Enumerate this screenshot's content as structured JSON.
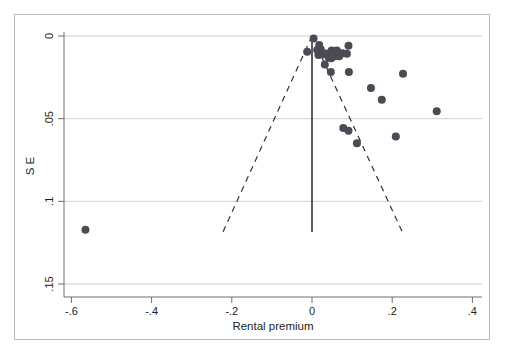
{
  "figure": {
    "type": "funnel-plot",
    "background_color": "#ffffff",
    "frame_color": "#b9b9b9"
  },
  "chart_data": {
    "type": "scatter",
    "title": "",
    "subtitle": "",
    "xlabel": "Rental premium",
    "ylabel": "S E",
    "xlim": [
      -0.72,
      0.5
    ],
    "ylim": [
      0.163,
      -0.008
    ],
    "y_inverted": true,
    "grid": "horizontal",
    "legend": "none",
    "xticks": [
      -0.6,
      -0.4,
      -0.2,
      0,
      0.2,
      0.4
    ],
    "xticklabels": [
      "-.6",
      "-.4",
      "-.2",
      "0",
      ".2",
      ".4"
    ],
    "yticks": [
      0,
      0.05,
      0.1,
      0.15
    ],
    "yticklabels": [
      "0",
      ".05",
      ".1",
      ".15"
    ],
    "marker_color": "#4b4b55",
    "marker_size": 5.4,
    "reference_line": {
      "name": "pooled-effect-line",
      "x": 0.0,
      "style": "solid",
      "color": "#333333",
      "y_from": 0.0,
      "y_to": 0.1185
    },
    "funnel_limits": {
      "name": "pseudo-95-confidence-limits",
      "style": "dashed",
      "color": "#333333",
      "apex": [
        0.0,
        0.0
      ],
      "left_end": [
        -0.222,
        0.1185
      ],
      "right_end": [
        0.225,
        0.1185
      ]
    },
    "points": [
      {
        "x": 0.004,
        "y": 0.0015
      },
      {
        "x": -0.012,
        "y": 0.0095
      },
      {
        "x": 0.018,
        "y": 0.0055
      },
      {
        "x": 0.013,
        "y": 0.0085
      },
      {
        "x": 0.022,
        "y": 0.0082
      },
      {
        "x": 0.016,
        "y": 0.0115
      },
      {
        "x": 0.026,
        "y": 0.0112
      },
      {
        "x": 0.036,
        "y": 0.0106
      },
      {
        "x": 0.049,
        "y": 0.0087
      },
      {
        "x": 0.062,
        "y": 0.0088
      },
      {
        "x": 0.091,
        "y": 0.0059
      },
      {
        "x": 0.076,
        "y": 0.0104
      },
      {
        "x": 0.087,
        "y": 0.0108
      },
      {
        "x": 0.042,
        "y": 0.0131
      },
      {
        "x": 0.048,
        "y": 0.0134
      },
      {
        "x": 0.058,
        "y": 0.0122
      },
      {
        "x": 0.068,
        "y": 0.0122
      },
      {
        "x": 0.032,
        "y": 0.0172
      },
      {
        "x": 0.047,
        "y": 0.0218
      },
      {
        "x": 0.092,
        "y": 0.0218
      },
      {
        "x": 0.227,
        "y": 0.0228
      },
      {
        "x": 0.147,
        "y": 0.0315
      },
      {
        "x": 0.174,
        "y": 0.0385
      },
      {
        "x": 0.311,
        "y": 0.0455
      },
      {
        "x": 0.078,
        "y": 0.0557
      },
      {
        "x": 0.091,
        "y": 0.0573
      },
      {
        "x": 0.209,
        "y": 0.0608
      },
      {
        "x": 0.112,
        "y": 0.0648
      },
      {
        "x": -0.565,
        "y": 0.1172
      }
    ]
  }
}
